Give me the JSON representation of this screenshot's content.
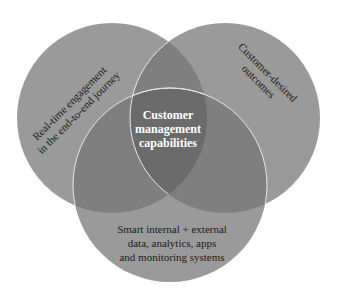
{
  "diagram": {
    "type": "venn",
    "colors": {
      "circle_fill": "#9a9a9a",
      "overlap_two": "#7e7e7e",
      "overlap_three": "#6a6a6a",
      "outline": "#e8e8e8",
      "background": "#ffffff"
    },
    "circles": [
      {
        "id": "left",
        "label_lines": [
          "Real-time engagement",
          "in the end-to-end journey"
        ]
      },
      {
        "id": "right",
        "label_lines": [
          "Customer-desired",
          "outcomes"
        ]
      },
      {
        "id": "bottom",
        "label_lines": [
          "Smart internal + external",
          "data, analytics, apps",
          "and monitoring systems"
        ]
      }
    ],
    "center": {
      "label_lines": [
        "Customer",
        "management",
        "capabilities"
      ]
    }
  }
}
